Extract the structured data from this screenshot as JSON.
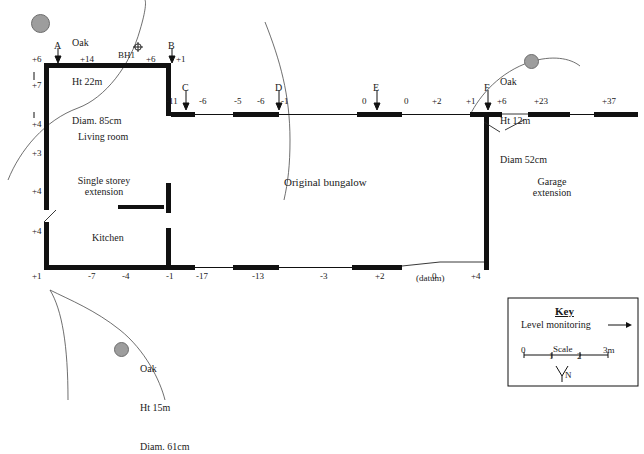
{
  "diagram": {
    "rooms": [
      {
        "id": "living-room",
        "label": "Living room",
        "x": 78,
        "y": 131
      },
      {
        "id": "single-storey",
        "label": "Single storey\nextension",
        "x": 70,
        "y": 181
      },
      {
        "id": "kitchen",
        "label": "Kitchen",
        "x": 92,
        "y": 237
      },
      {
        "id": "original-bungalow",
        "label": "Original bungalow",
        "x": 284,
        "y": 181
      },
      {
        "id": "garage",
        "label": "Garage\nextension",
        "x": 544,
        "y": 181
      }
    ],
    "station_labels": [
      {
        "id": "A",
        "label": "A",
        "x": 54,
        "y": 44
      },
      {
        "id": "B",
        "label": "B",
        "x": 168,
        "y": 44
      },
      {
        "id": "C",
        "label": "C",
        "x": 182,
        "y": 86
      },
      {
        "id": "D",
        "label": "D",
        "x": 275,
        "y": 86
      },
      {
        "id": "E",
        "label": "E",
        "x": 373,
        "y": 86
      },
      {
        "id": "F",
        "label": "F",
        "x": 484,
        "y": 86
      }
    ],
    "borehole": {
      "label": "BH1",
      "x": 120,
      "y": 54
    },
    "datum_note": {
      "label": "(datum)",
      "x": 418,
      "y": 276
    },
    "levels": [
      {
        "value": "+6",
        "x": 32,
        "y": 58
      },
      {
        "value": "+14",
        "x": 80,
        "y": 58
      },
      {
        "value": "+6",
        "x": 146,
        "y": 58
      },
      {
        "value": "+1",
        "x": 176,
        "y": 58
      },
      {
        "value": "+7",
        "x": 32,
        "y": 84
      },
      {
        "value": "+4",
        "x": 32,
        "y": 123
      },
      {
        "value": "+3",
        "x": 32,
        "y": 152
      },
      {
        "value": "+4",
        "x": 32,
        "y": 190
      },
      {
        "value": "+4",
        "x": 32,
        "y": 230
      },
      {
        "value": "+1",
        "x": 32,
        "y": 268
      },
      {
        "value": "-11",
        "x": 168,
        "y": 100
      },
      {
        "value": "-6",
        "x": 199,
        "y": 100
      },
      {
        "value": "-5",
        "x": 234,
        "y": 100
      },
      {
        "value": "-6",
        "x": 257,
        "y": 100
      },
      {
        "value": "-1",
        "x": 281,
        "y": 100
      },
      {
        "value": "0",
        "x": 362,
        "y": 100
      },
      {
        "value": "0",
        "x": 404,
        "y": 100
      },
      {
        "value": "+2",
        "x": 432,
        "y": 100
      },
      {
        "value": "+1",
        "x": 466,
        "y": 100
      },
      {
        "value": "+6",
        "x": 497,
        "y": 100
      },
      {
        "value": "+23",
        "x": 536,
        "y": 100
      },
      {
        "value": "+37",
        "x": 604,
        "y": 100
      },
      {
        "value": "-7",
        "x": 88,
        "y": 268
      },
      {
        "value": "-4",
        "x": 122,
        "y": 268
      },
      {
        "value": "-1",
        "x": 168,
        "y": 268
      },
      {
        "value": "-17",
        "x": 198,
        "y": 268
      },
      {
        "value": "-13",
        "x": 254,
        "y": 268
      },
      {
        "value": "-3",
        "x": 320,
        "y": 268
      },
      {
        "value": "+2",
        "x": 375,
        "y": 268
      },
      {
        "value": "0",
        "x": 432,
        "y": 268
      },
      {
        "value": "+4",
        "x": 473,
        "y": 268
      }
    ],
    "trees": [
      {
        "id": "oak-top-left",
        "lines": [
          "Oak",
          "Ht 22m",
          "Diam. 85cm"
        ],
        "label_x": 72,
        "label_y": 12,
        "circle_x": 39,
        "circle_y": 22,
        "circle_d": 17
      },
      {
        "id": "oak-right",
        "lines": [
          "Oak",
          "Ht 12m",
          "Diam 52cm"
        ],
        "label_x": 500,
        "label_y": 51,
        "circle_x": 530,
        "circle_y": 60,
        "circle_d": 13
      },
      {
        "id": "oak-bottom",
        "lines": [
          "Oak",
          "Ht 15m",
          "Diam. 61cm"
        ],
        "label_x": 140,
        "label_y": 338,
        "circle_x": 120,
        "circle_y": 348,
        "circle_d": 13
      }
    ],
    "key": {
      "title": "Key",
      "entry_label": "Level monitoring",
      "scale_label": "Scale",
      "scale_ticks": [
        "0",
        "1",
        "2",
        "3m"
      ],
      "north_label": "N"
    }
  },
  "colors": {
    "wall": "#111111",
    "tree_fill": "#9d9d9d",
    "line": "#333333",
    "background": "#ffffff"
  }
}
